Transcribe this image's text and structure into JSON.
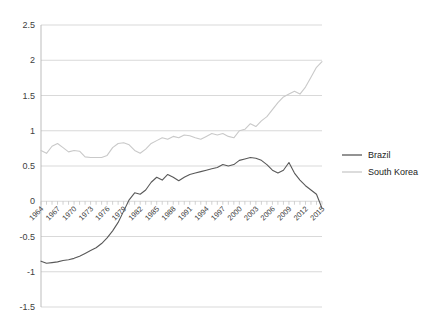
{
  "chart_data": {
    "type": "line",
    "title": "",
    "subtitle": "",
    "xlabel": "",
    "ylabel": "",
    "xlim": [
      1964,
      2015
    ],
    "ylim": [
      -1.5,
      2.5
    ],
    "grid": true,
    "legend_position": "right",
    "y_ticks": [
      "2.5",
      "2",
      "1.5",
      "1",
      "0.5",
      "0",
      "-0.5",
      "-1",
      "-1.5"
    ],
    "y_tick_values": [
      2.5,
      2,
      1.5,
      1,
      0.5,
      0,
      -0.5,
      -1,
      -1.5
    ],
    "x_tick_labels": [
      "1964",
      "1967",
      "1970",
      "1973",
      "1976",
      "1979",
      "1982",
      "1985",
      "1988",
      "1991",
      "1994",
      "1997",
      "2000",
      "2003",
      "2006",
      "2009",
      "2012",
      "2015"
    ],
    "x_tick_values": [
      1964,
      1967,
      1970,
      1973,
      1976,
      1979,
      1982,
      1985,
      1988,
      1991,
      1994,
      1997,
      2000,
      2003,
      2006,
      2009,
      2012,
      2015
    ],
    "x": [
      1964,
      1965,
      1966,
      1967,
      1968,
      1969,
      1970,
      1971,
      1972,
      1973,
      1974,
      1975,
      1976,
      1977,
      1978,
      1979,
      1980,
      1981,
      1982,
      1983,
      1984,
      1985,
      1986,
      1987,
      1988,
      1989,
      1990,
      1991,
      1992,
      1993,
      1994,
      1995,
      1996,
      1997,
      1998,
      1999,
      2000,
      2001,
      2002,
      2003,
      2004,
      2005,
      2006,
      2007,
      2008,
      2009,
      2010,
      2011,
      2012,
      2013,
      2014,
      2015
    ],
    "series": [
      {
        "name": "Brazil",
        "color": "#595959",
        "values": [
          -0.85,
          -0.88,
          -0.87,
          -0.86,
          -0.84,
          -0.83,
          -0.81,
          -0.78,
          -0.74,
          -0.7,
          -0.66,
          -0.6,
          -0.52,
          -0.42,
          -0.3,
          -0.14,
          0.02,
          0.12,
          0.1,
          0.16,
          0.27,
          0.34,
          0.3,
          0.38,
          0.34,
          0.29,
          0.34,
          0.38,
          0.4,
          0.42,
          0.44,
          0.46,
          0.48,
          0.52,
          0.5,
          0.52,
          0.58,
          0.6,
          0.62,
          0.61,
          0.58,
          0.52,
          0.44,
          0.4,
          0.44,
          0.55,
          0.4,
          0.3,
          0.22,
          0.16,
          0.1,
          -0.1
        ]
      },
      {
        "name": "South Korea",
        "color": "#c9c9c9",
        "values": [
          0.72,
          0.68,
          0.78,
          0.82,
          0.76,
          0.7,
          0.72,
          0.71,
          0.63,
          0.62,
          0.62,
          0.62,
          0.65,
          0.76,
          0.82,
          0.83,
          0.8,
          0.72,
          0.68,
          0.74,
          0.82,
          0.86,
          0.9,
          0.88,
          0.92,
          0.9,
          0.94,
          0.93,
          0.9,
          0.88,
          0.92,
          0.96,
          0.94,
          0.96,
          0.92,
          0.9,
          1.0,
          1.02,
          1.1,
          1.06,
          1.14,
          1.2,
          1.3,
          1.4,
          1.48,
          1.52,
          1.56,
          1.52,
          1.62,
          1.76,
          1.9,
          1.98
        ]
      }
    ]
  },
  "legend": {
    "items": [
      {
        "label": "Brazil",
        "color": "#595959"
      },
      {
        "label": "South Korea",
        "color": "#c9c9c9"
      }
    ]
  }
}
